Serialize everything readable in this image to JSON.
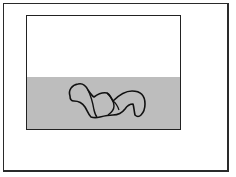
{
  "figure": {
    "outer_frame": {
      "x": 3,
      "y": 3,
      "width": 226,
      "height": 169
    },
    "inner_rect": {
      "x": 26,
      "y": 15,
      "width": 155,
      "height": 115
    },
    "regions": [
      {
        "name": "upper",
        "fill": "#ffffff"
      },
      {
        "name": "lower",
        "fill": "#bdbdbd",
        "pattern": "stipple"
      }
    ],
    "blob": {
      "stroke": "#111111",
      "lobes": [
        "left",
        "center",
        "right"
      ]
    }
  }
}
